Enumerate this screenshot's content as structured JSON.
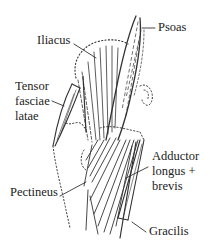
{
  "diagram": {
    "colors": {
      "line": "#333333",
      "text": "#222222",
      "background": "#ffffff"
    },
    "labels": {
      "psoas": {
        "lines": [
          "Psoas"
        ]
      },
      "iliacus": {
        "lines": [
          "Iliacus"
        ]
      },
      "tensor": {
        "lines": [
          "Tensor",
          "fasciae",
          "latae"
        ]
      },
      "adductor": {
        "lines": [
          "Adductor",
          "longus +",
          "brevis"
        ]
      },
      "pectineus": {
        "lines": [
          "Pectineus"
        ]
      },
      "gracilis": {
        "lines": [
          "Gracilis"
        ]
      }
    }
  }
}
